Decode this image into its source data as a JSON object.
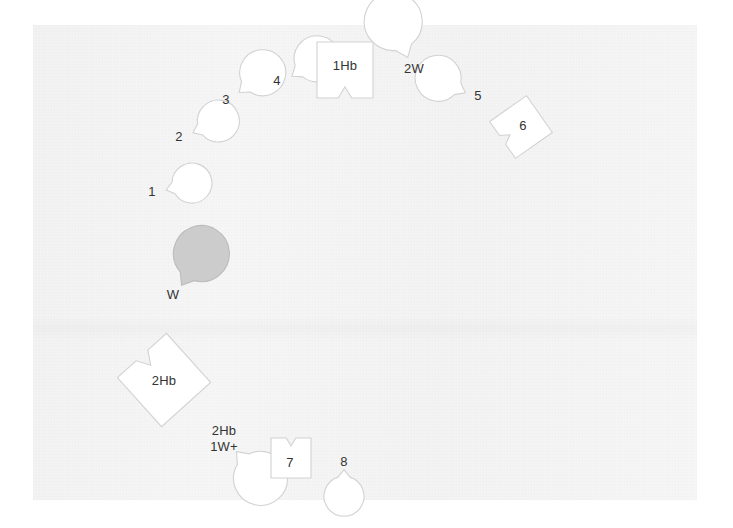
{
  "figure": {
    "title": "",
    "background_color": "#f4f4f4",
    "page_color": "#ffffff",
    "outline_color": "#d2d2d2",
    "fill_color": "#ffffff",
    "shaded_fill_color": "#cccccc",
    "label_color": "#333333",
    "panel": {
      "x": 33,
      "y": 25,
      "width": 664,
      "height": 475
    }
  },
  "cells": [
    {
      "id": "cell-1",
      "label": "1",
      "shape": "circle-notched",
      "cx": 155,
      "cy": 193,
      "r": 20,
      "notch_angle": 15,
      "filled": false,
      "label_dx": -3,
      "label_dy": 0
    },
    {
      "id": "cell-2",
      "label": "2",
      "shape": "circle-notched",
      "cx": 182,
      "cy": 138,
      "r": 21,
      "notch_angle": 25,
      "filled": false,
      "label_dx": -3,
      "label_dy": 0
    },
    {
      "id": "cell-3",
      "label": "3",
      "shape": "circle-notched",
      "cx": 229,
      "cy": 101,
      "r": 23,
      "notch_angle": 40,
      "filled": false,
      "label_dx": -3,
      "label_dy": 0
    },
    {
      "id": "cell-4",
      "label": "4",
      "shape": "circle-notched",
      "cx": 281,
      "cy": 84,
      "r": 23,
      "notch_angle": 35,
      "filled": false,
      "label_dx": -4,
      "label_dy": -2
    },
    {
      "id": "cell-1hb",
      "label": "1Hb",
      "shape": "square-notched",
      "cx": 345,
      "cy": 70,
      "size": 56,
      "rotation": 0,
      "notch_side": "bottom",
      "filled": false,
      "label_dx": 0,
      "label_dy": -3
    },
    {
      "id": "cell-2w",
      "label": "2W",
      "shape": "circle-notched",
      "cx": 414,
      "cy": 73,
      "r": 29,
      "notch_angle": 112,
      "filled": false,
      "label_dx": 0,
      "label_dy": -3
    },
    {
      "id": "cell-5",
      "label": "5",
      "shape": "circle-notched",
      "cx": 477,
      "cy": 99,
      "r": 23,
      "notch_angle": 152,
      "filled": false,
      "label_dx": 1,
      "label_dy": -2
    },
    {
      "id": "cell-6",
      "label": "6",
      "shape": "square-notched",
      "cx": 521,
      "cy": 127,
      "size": 45,
      "rotation": -35,
      "notch_side": "left",
      "filled": false,
      "label_dx": 2,
      "label_dy": 0
    },
    {
      "id": "cell-w",
      "label": "W",
      "shape": "circle-notched",
      "cx": 173,
      "cy": 299,
      "r": 28,
      "notch_angle": 58,
      "filled": true,
      "label_dx": 0,
      "label_dy": -3
    },
    {
      "id": "cell-2hb",
      "label": "2Hb",
      "shape": "square-notched",
      "cx": 164,
      "cy": 380,
      "size": 66,
      "rotation": -42,
      "notch_side": "top",
      "filled": false,
      "label_dx": 0,
      "label_dy": 2
    },
    {
      "id": "cell-2hb-1w",
      "label": "2Hb\n1W+",
      "label_lines": [
        "2Hb",
        "1W+"
      ],
      "shape": "circle-notched",
      "cx": 226,
      "cy": 440,
      "r": 27,
      "notch_angle": -48,
      "filled": false,
      "label_dx": -2,
      "label_dy": 0
    },
    {
      "id": "cell-7",
      "label": "7",
      "shape": "square-notched",
      "cx": 291,
      "cy": 458,
      "size": 40,
      "rotation": 0,
      "notch_side": "top",
      "filled": false,
      "label_dx": -1,
      "label_dy": 6
    },
    {
      "id": "cell-8",
      "label": "8",
      "shape": "circle-notched",
      "cx": 344,
      "cy": 458,
      "r": 20,
      "notch_angle": -90,
      "filled": false,
      "label_dx": 0,
      "label_dy": 5
    }
  ]
}
